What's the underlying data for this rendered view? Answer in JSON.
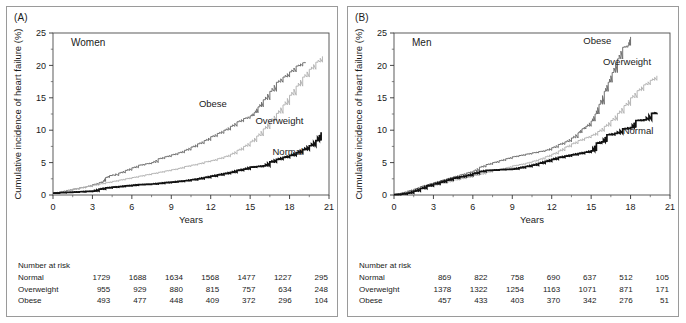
{
  "figure": {
    "panels": [
      {
        "tag": "(A)",
        "group_title": "Women",
        "xlabel": "Years",
        "ylabel": "Cumulative incidence of heart failure (%)",
        "risk_title": "Number at risk",
        "risk_rows": [
          {
            "label": "Normal",
            "values": [
              "1729",
              "1688",
              "1634",
              "1568",
              "1477",
              "1227",
              "295"
            ]
          },
          {
            "label": "Overweight",
            "values": [
              "955",
              "929",
              "880",
              "815",
              "757",
              "634",
              "248"
            ]
          },
          {
            "label": "Obese",
            "values": [
              "493",
              "477",
              "448",
              "409",
              "372",
              "296",
              "104"
            ]
          }
        ],
        "curve_labels": {
          "obese": "Obese",
          "overweight": "Overweight",
          "normal": "Normal"
        }
      },
      {
        "tag": "(B)",
        "group_title": "Men",
        "xlabel": "Years",
        "ylabel": "Cumulative incidence of heart failure (%)",
        "risk_title": "Number at risk",
        "risk_rows": [
          {
            "label": "Normal",
            "values": [
              "869",
              "822",
              "758",
              "690",
              "637",
              "512",
              "105"
            ]
          },
          {
            "label": "Overweight",
            "values": [
              "1378",
              "1322",
              "1254",
              "1163",
              "1071",
              "871",
              "171"
            ]
          },
          {
            "label": "Obese",
            "values": [
              "457",
              "433",
              "403",
              "370",
              "342",
              "276",
              "51"
            ]
          }
        ],
        "curve_labels": {
          "obese": "Obese",
          "overweight": "Overweight",
          "normal": "Normal"
        }
      }
    ]
  },
  "chart_data": [
    {
      "type": "line",
      "title": "Women",
      "panel": "(A)",
      "xlabel": "Years",
      "ylabel": "Cumulative incidence of heart failure (%)",
      "xlim": [
        0,
        21
      ],
      "ylim": [
        0,
        25
      ],
      "xticks": [
        0,
        3,
        6,
        9,
        12,
        15,
        18,
        21
      ],
      "yticks": [
        0,
        5,
        10,
        15,
        20,
        25
      ],
      "minor_xticks": true,
      "minor_yticks": true,
      "grid": false,
      "legend": "inline-labels",
      "colors": {
        "normal": "#111111",
        "overweight": "#b5b5b5",
        "obese": "#6f6f6f"
      },
      "series": [
        {
          "name": "Obese",
          "color": "#6f6f6f",
          "x": [
            0,
            0.5,
            1,
            1.5,
            2,
            2.5,
            3,
            3.5,
            3.8,
            4.0,
            4.3,
            5,
            5.5,
            6,
            6.5,
            7,
            7.5,
            8,
            8.5,
            9,
            9.5,
            10,
            10.5,
            11,
            11.5,
            12,
            12.5,
            13,
            13.5,
            14,
            14.5,
            15,
            15.3,
            15.6,
            16,
            16.5,
            17,
            17.5,
            18,
            18.5,
            19,
            19.2
          ],
          "y": [
            0.3,
            0.5,
            0.7,
            0.9,
            1.1,
            1.3,
            1.6,
            1.9,
            2.1,
            2.7,
            3.0,
            3.4,
            3.8,
            4.2,
            4.6,
            4.8,
            5.0,
            5.6,
            5.9,
            6.2,
            6.5,
            6.9,
            7.4,
            7.9,
            8.4,
            9.0,
            9.5,
            10.0,
            10.6,
            11.3,
            11.8,
            12.2,
            12.7,
            13.6,
            14.7,
            16.0,
            17.4,
            18.2,
            19.0,
            19.9,
            20.4,
            20.5
          ]
        },
        {
          "name": "Overweight",
          "color": "#b5b5b5",
          "x": [
            0,
            0.5,
            1,
            1.5,
            2,
            2.5,
            3,
            3.5,
            4,
            4.5,
            5,
            5.5,
            6,
            6.5,
            7,
            7.5,
            8,
            8.5,
            9,
            9.5,
            10,
            10.5,
            11,
            11.5,
            12,
            12.5,
            13,
            13.5,
            14,
            14.5,
            15,
            15.5,
            16,
            16.5,
            17,
            17.5,
            18,
            18.5,
            19,
            19.5,
            20,
            20.5
          ],
          "y": [
            0.15,
            0.4,
            0.6,
            0.9,
            1.1,
            1.3,
            1.5,
            1.7,
            1.9,
            2.1,
            2.3,
            2.5,
            2.7,
            2.9,
            3.1,
            3.3,
            3.5,
            3.7,
            3.9,
            4.1,
            4.4,
            4.6,
            4.8,
            5.1,
            5.3,
            5.6,
            5.9,
            6.3,
            6.9,
            7.5,
            8.2,
            9.1,
            10.2,
            11.4,
            12.6,
            13.9,
            15.4,
            16.8,
            18.2,
            19.4,
            20.5,
            21.4
          ]
        },
        {
          "name": "Normal",
          "color": "#111111",
          "x": [
            0,
            0.5,
            1,
            1.5,
            2,
            2.5,
            3,
            3.5,
            4,
            4.5,
            5,
            5.5,
            6,
            6.5,
            7,
            7.5,
            8,
            8.5,
            9,
            9.5,
            10,
            10.5,
            11,
            11.5,
            12,
            12.5,
            13,
            13.5,
            14,
            14.5,
            15,
            15.5,
            16,
            16.5,
            17,
            17.5,
            18,
            18.5,
            19,
            19.5,
            20,
            20.4
          ],
          "y": [
            0.3,
            0.35,
            0.4,
            0.45,
            0.5,
            0.55,
            0.6,
            0.9,
            1.1,
            1.2,
            1.3,
            1.4,
            1.5,
            1.6,
            1.65,
            1.7,
            1.8,
            1.9,
            2.0,
            2.1,
            2.2,
            2.35,
            2.5,
            2.7,
            2.9,
            3.1,
            3.3,
            3.5,
            3.8,
            4.0,
            4.3,
            4.4,
            4.5,
            5.1,
            5.5,
            5.8,
            6.1,
            6.5,
            7.0,
            7.6,
            8.4,
            9.7
          ]
        }
      ]
    },
    {
      "type": "line",
      "title": "Men",
      "panel": "(B)",
      "xlabel": "Years",
      "ylabel": "Cumulative incidence of heart failure (%)",
      "xlim": [
        0,
        21
      ],
      "ylim": [
        0,
        25
      ],
      "xticks": [
        0,
        3,
        6,
        9,
        12,
        15,
        18,
        21
      ],
      "yticks": [
        0,
        5,
        10,
        15,
        20,
        25
      ],
      "minor_xticks": true,
      "minor_yticks": true,
      "grid": false,
      "legend": "inline-labels",
      "colors": {
        "normal": "#111111",
        "overweight": "#b5b5b5",
        "obese": "#6f6f6f"
      },
      "series": [
        {
          "name": "Obese",
          "color": "#6f6f6f",
          "x": [
            0,
            0.5,
            1,
            1.5,
            2,
            2.5,
            3,
            3.5,
            4,
            4.5,
            5,
            5.5,
            6,
            6.5,
            7,
            7.5,
            8,
            8.5,
            9,
            9.5,
            10,
            10.5,
            11,
            11.5,
            12,
            12.5,
            13,
            13.5,
            14,
            14.3,
            14.6,
            15,
            15.3,
            15.6,
            16,
            16.3,
            16.6,
            17,
            17.4,
            17.8,
            18
          ],
          "y": [
            0.1,
            0.3,
            0.6,
            0.9,
            1.3,
            1.6,
            1.9,
            2.2,
            2.5,
            2.8,
            3.1,
            3.4,
            3.7,
            4.3,
            4.7,
            5.0,
            5.3,
            5.6,
            5.9,
            6.1,
            6.3,
            6.5,
            6.7,
            6.9,
            7.3,
            7.8,
            8.2,
            8.8,
            9.6,
            10.2,
            10.6,
            11.4,
            12.5,
            14.0,
            16.0,
            17.4,
            18.9,
            21.0,
            22.8,
            23.1,
            24.4
          ]
        },
        {
          "name": "Overweight",
          "color": "#b5b5b5",
          "x": [
            0,
            0.5,
            1,
            1.5,
            2,
            2.5,
            3,
            3.5,
            4,
            4.5,
            5,
            5.5,
            6,
            6.5,
            7,
            7.5,
            8,
            8.5,
            9,
            9.5,
            10,
            10.5,
            11,
            11.5,
            12,
            12.5,
            13,
            13.5,
            14,
            14.5,
            15,
            15.5,
            16,
            16.5,
            17,
            17.5,
            18,
            18.5,
            19,
            19.5,
            20
          ],
          "y": [
            0.05,
            0.2,
            0.4,
            0.7,
            1.0,
            1.3,
            1.5,
            1.8,
            2.0,
            2.3,
            2.5,
            2.7,
            3.0,
            3.2,
            3.5,
            3.8,
            4.0,
            4.2,
            4.5,
            4.7,
            4.9,
            5.2,
            5.5,
            5.9,
            6.3,
            6.8,
            7.4,
            7.9,
            8.4,
            8.8,
            9.2,
            9.8,
            10.6,
            11.5,
            12.6,
            13.8,
            15.0,
            16.1,
            17.0,
            17.7,
            18.4
          ]
        },
        {
          "name": "Normal",
          "color": "#111111",
          "x": [
            0,
            0.5,
            1,
            1.5,
            2,
            2.5,
            3,
            3.5,
            4,
            4.5,
            5,
            5.5,
            6,
            6.5,
            7,
            7.5,
            8,
            8.5,
            9,
            9.5,
            10,
            10.5,
            11,
            11.5,
            12,
            12.5,
            13,
            13.5,
            14,
            14.5,
            15,
            15.4,
            15.8,
            16.2,
            16.8,
            17.4,
            18,
            18.4,
            19,
            19.6,
            20
          ],
          "y": [
            0.05,
            0.15,
            0.3,
            0.6,
            1.0,
            1.4,
            1.7,
            2.0,
            2.3,
            2.6,
            2.8,
            3.0,
            3.3,
            3.6,
            3.8,
            3.85,
            3.9,
            3.95,
            4.0,
            4.2,
            4.4,
            4.6,
            4.9,
            5.2,
            5.5,
            5.8,
            6.0,
            6.2,
            6.4,
            6.6,
            6.8,
            8.0,
            8.2,
            9.3,
            9.5,
            10.2,
            10.4,
            11.5,
            11.6,
            12.6,
            12.7
          ]
        }
      ]
    }
  ]
}
